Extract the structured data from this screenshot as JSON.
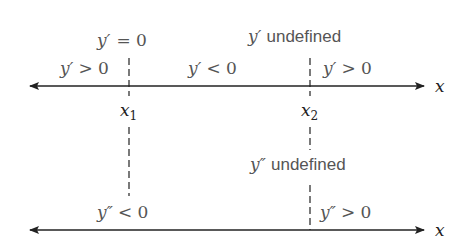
{
  "diagram": {
    "type": "sign-chart",
    "colors": {
      "axis": "#222222",
      "label": "#555555"
    },
    "top_axis": {
      "variable": "x",
      "points": [
        {
          "name": "x",
          "sub": "1",
          "annotation_var": "y′",
          "annotation": "= 0"
        },
        {
          "name": "x",
          "sub": "2",
          "annotation_var": "y′",
          "annotation": "undefined"
        }
      ],
      "intervals": [
        {
          "var": "y′",
          "sign": "> 0"
        },
        {
          "var": "y′",
          "sign": "< 0"
        },
        {
          "var": "y′",
          "sign": "> 0"
        }
      ]
    },
    "bottom_axis": {
      "variable": "x",
      "points": [
        {
          "annotation_var": "y″",
          "annotation": "undefined"
        }
      ],
      "intervals": [
        {
          "var": "y″",
          "sign": "< 0"
        },
        {
          "var": "y″",
          "sign": "> 0"
        }
      ]
    }
  }
}
